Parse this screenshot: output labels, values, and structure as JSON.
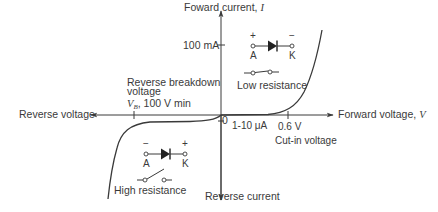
{
  "diagram": {
    "axes": {
      "y_positive_label": "Foward current,",
      "y_positive_symbol": "I",
      "y_negative_label": "Reverse current",
      "x_positive_label": "Forward voltage,",
      "x_positive_symbol": "V",
      "x_negative_label": "Reverse voltage",
      "origin_label": "0"
    },
    "annotations": {
      "forward_current_tick": "100 mA",
      "leakage_current": "1-10 μA",
      "cut_in_value": "0.6 V",
      "cut_in_label": "Cut-in voltage",
      "breakdown_line1": "Reverse breakdown",
      "breakdown_line2": "voltage",
      "breakdown_symbol": "V",
      "breakdown_subscript": "B",
      "breakdown_value": ", 100 V min"
    },
    "forward_bias": {
      "anode_polarity": "+",
      "cathode_polarity": "−",
      "anode_label": "A",
      "cathode_label": "K",
      "switch_state": "closed",
      "caption": "Low resistance"
    },
    "reverse_bias": {
      "anode_polarity": "−",
      "cathode_polarity": "+",
      "anode_label": "A",
      "cathode_label": "K",
      "switch_state": "open",
      "caption": "High resistance"
    },
    "colors": {
      "line": "#3a3a3a",
      "text": "#3a3a3a",
      "background": "#ffffff"
    }
  }
}
